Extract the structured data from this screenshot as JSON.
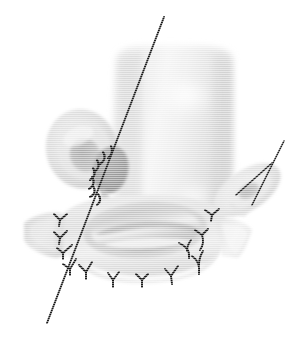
{
  "figure": {
    "title": "Surgical anastomosis illustration",
    "type": "grayscale-anatomical-line-drawing",
    "background_color": "#ffffff",
    "width": 307,
    "height": 348,
    "palette": {
      "background": "#ffffff",
      "tissue_light": "#ececec",
      "tissue_mid": "#d8d8d8",
      "tissue_shadow": "#c0c0c0",
      "tissue_dark": "#a8a8a8",
      "blob_gray": "#9a9a9a",
      "lumen_gray": "#b4b4b4",
      "highlight": "#fbfbfb",
      "suture_black": "#141414",
      "pointer_black": "#1a1a1a"
    },
    "structures": [
      {
        "name": "main-conduit",
        "label": "vertical tubular conduit",
        "fill": "#e6e6e6",
        "description": "large upright tube occupying upper centre of frame"
      },
      {
        "name": "left-oval-vessel",
        "label": "left oval vessel stump",
        "fill": "#d9d9d9",
        "description": "oval cross-section with darker inner lumen, upper left"
      },
      {
        "name": "right-oval-vessel",
        "label": "right oval vessel stump",
        "fill": "#dedede",
        "description": "small oblique oval with inner lumen, right side"
      },
      {
        "name": "central-gray-blob",
        "label": "dark patch graft",
        "fill": "#9b9b9b",
        "description": "rounded darker patch at junction of left vessel and conduit"
      },
      {
        "name": "base-cuff",
        "label": "anastomotic base cuff",
        "fill": "#e2e2e2",
        "description": "broad horizontal cuff forming the lower anastomosis"
      },
      {
        "name": "central-lumen-ring",
        "label": "central lumen opening",
        "fill": "#c4c4c4",
        "description": "elliptical opening in the centre of the base cuff"
      },
      {
        "name": "left-flange",
        "label": "left tissue flange",
        "fill": "#dcdcdc"
      },
      {
        "name": "right-flange",
        "label": "right tissue flange",
        "fill": "#e0e0e0"
      }
    ],
    "annotations": {
      "pointer_lines": [
        {
          "name": "primary-pointer-line",
          "from": [
            164,
            17
          ],
          "to": [
            47,
            323
          ],
          "stroke": "#1a1a1a",
          "width": 1.9
        },
        {
          "name": "secondary-pointer-line",
          "from": [
            284,
            141
          ],
          "to": [
            252,
            205
          ],
          "stroke": "#1a1a1a",
          "width": 1.6
        },
        {
          "name": "secondary-pointer-branch",
          "from": [
            272,
            163
          ],
          "to": [
            236,
            195
          ],
          "stroke": "#1a1a1a",
          "width": 1.6
        }
      ],
      "suture_groups": [
        {
          "name": "upper-left-interrupted-sutures",
          "count": 7,
          "style": "short-curved-stitch",
          "description": "interrupted stitches along left vessel to patch junction"
        },
        {
          "name": "left-lateral-sutures",
          "count": 4,
          "style": "y-knot",
          "description": "knot ties on the left flange margin"
        },
        {
          "name": "bottom-cuff-sutures",
          "count": 5,
          "style": "y-knot",
          "description": "knot ties along inferior margin of base cuff"
        },
        {
          "name": "right-cuff-sutures",
          "count": 3,
          "style": "y-knot",
          "description": "knot ties at right side of anastomosis"
        }
      ],
      "total_suture_knots": 19
    }
  }
}
